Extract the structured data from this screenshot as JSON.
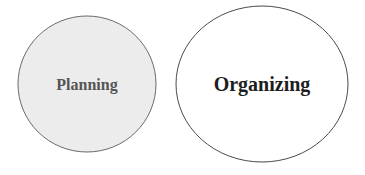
{
  "diagram": {
    "nodes": [
      {
        "label": "Planning",
        "fill": "#ececec",
        "stroke": "#6a6a6a",
        "text_color": "#555555"
      },
      {
        "label": "Organizing",
        "fill": "#ffffff",
        "stroke": "#4a4a4a",
        "text_color": "#1e1e1e"
      }
    ]
  }
}
